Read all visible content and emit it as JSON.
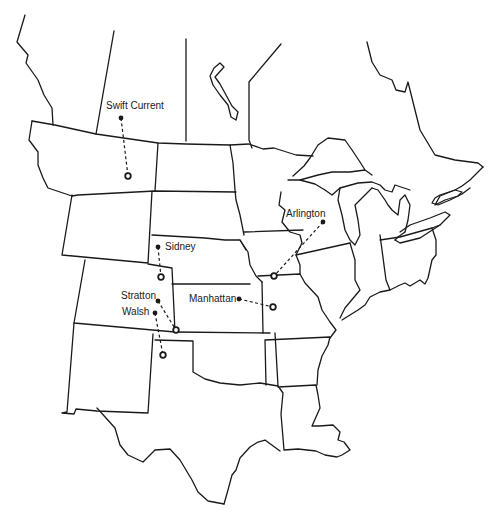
{
  "map": {
    "sites": [
      {
        "name": "Swift Current",
        "origin": [
          121,
          118
        ],
        "destination": [
          128,
          176
        ],
        "label_pos": [
          106,
          101
        ]
      },
      {
        "name": "Sidney",
        "origin": [
          158,
          247
        ],
        "destination": [
          161,
          277
        ],
        "label_pos": [
          165,
          242
        ]
      },
      {
        "name": "Stratton",
        "origin": [
          158,
          301
        ],
        "destination": [
          176,
          330
        ],
        "label_pos": [
          121,
          291
        ]
      },
      {
        "name": "Walsh",
        "origin": [
          155,
          313
        ],
        "destination": [
          163,
          355
        ],
        "label_pos": [
          122,
          307
        ]
      },
      {
        "name": "Manhattan",
        "origin": [
          239,
          299
        ],
        "destination": [
          273,
          307
        ],
        "label_pos": [
          189,
          294
        ]
      },
      {
        "name": "Arlington",
        "origin": [
          323,
          222
        ],
        "destination": [
          274,
          276
        ],
        "label_pos": [
          286,
          209
        ]
      }
    ],
    "legend": {
      "origin_marker": "filled-dot",
      "destination_marker": "open-circle"
    },
    "colors": {
      "ink": "#1a1a1a",
      "background": "#ffffff"
    }
  }
}
